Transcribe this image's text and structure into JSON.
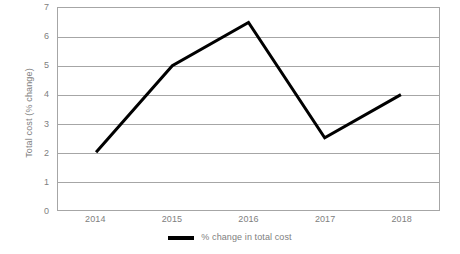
{
  "chart_data": {
    "type": "line",
    "title": "",
    "xlabel": "",
    "ylabel": "Total cost (% change)",
    "categories": [
      "2014",
      "2015",
      "2016",
      "2017",
      "2018"
    ],
    "series": [
      {
        "name": "% change in total cost",
        "values": [
          2,
          5,
          6.5,
          2.5,
          4
        ],
        "color": "#000000"
      }
    ],
    "ylim": [
      0,
      7
    ],
    "yticks": [
      0,
      1,
      2,
      3,
      4,
      5,
      6,
      7
    ],
    "ytick_labels": [
      "0",
      "1",
      "2",
      "3",
      "4",
      "5",
      "6",
      "7"
    ],
    "grid": true,
    "grid_axis": "y",
    "legend": true,
    "legend_position": "bottom-center",
    "legend_entries": [
      "% change in total cost"
    ],
    "plot_border": true,
    "axis_color": "#a6a6a6",
    "text_color": "#808080",
    "background": "#ffffff"
  }
}
